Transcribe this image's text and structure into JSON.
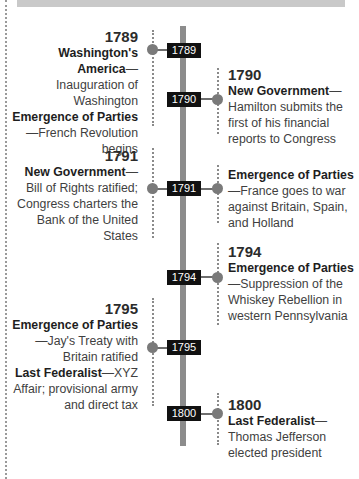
{
  "timeline": {
    "axis_color": "#8c8c8c",
    "markers": [
      {
        "label": "1789"
      },
      {
        "label": "1790"
      },
      {
        "label": "1791"
      },
      {
        "label": "1794"
      },
      {
        "label": "1795"
      },
      {
        "label": "1800"
      }
    ]
  },
  "entries": [
    {
      "side": "left",
      "year": "1789",
      "items": [
        {
          "category": "Washington's America",
          "dash": "—",
          "text": "Inauguration of Washington"
        },
        {
          "category": "Emergence of Parties",
          "dash": "—",
          "text": "French Revolution begins"
        }
      ]
    },
    {
      "side": "right",
      "year": "1790",
      "items": [
        {
          "category": "New Government",
          "dash": "—",
          "text": "Hamilton submits the first of his financial reports to Congress"
        }
      ]
    },
    {
      "side": "left",
      "year": "1791",
      "items": [
        {
          "category": "New Government",
          "dash": "—",
          "text": "Bill of Rights ratified; Congress charters the Bank of the United States"
        }
      ]
    },
    {
      "side": "right",
      "year": "",
      "items": [
        {
          "category": "Emergence of Parties",
          "dash": "—",
          "text": "France goes to war against Britain, Spain, and Holland"
        }
      ]
    },
    {
      "side": "right",
      "year": "1794",
      "items": [
        {
          "category": "Emergence of Parties",
          "dash": "—",
          "text": "Suppression of the Whiskey Rebellion in western Pennsylvania"
        }
      ]
    },
    {
      "side": "left",
      "year": "1795",
      "items": [
        {
          "category": "Emergence of Parties",
          "dash": "—",
          "text": "Jay's Treaty with Britain ratified"
        },
        {
          "category": "Last Federalist",
          "dash": "—",
          "text": "XYZ Affair; provisional army and direct tax"
        }
      ]
    },
    {
      "side": "right",
      "year": "1800",
      "items": [
        {
          "category": "Last Federalist",
          "dash": "—",
          "text": "Thomas Jefferson elected president"
        }
      ]
    }
  ]
}
